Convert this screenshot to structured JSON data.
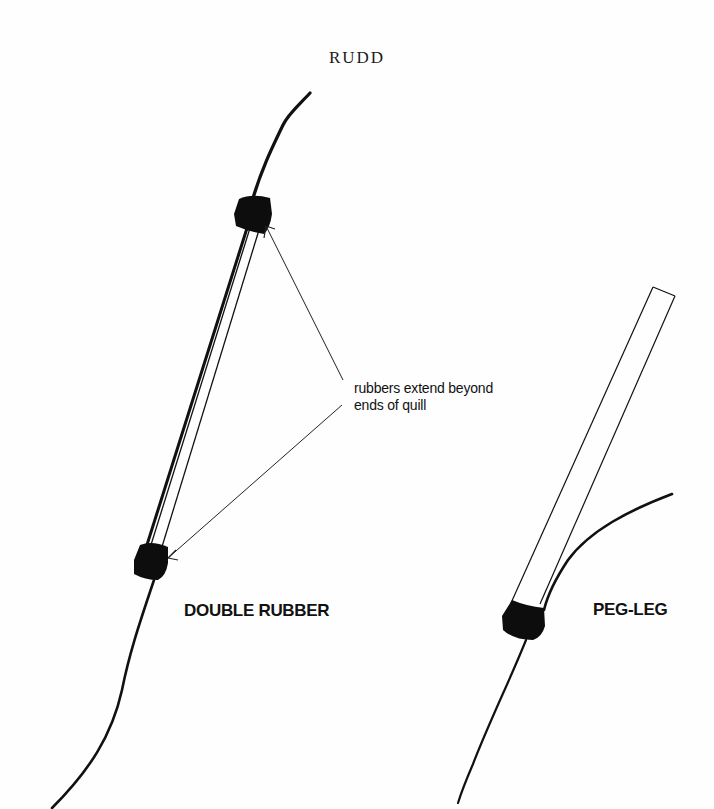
{
  "title": "RUDD",
  "callout": {
    "line1": "rubbers extend beyond",
    "line2": "ends of quill"
  },
  "rigs": [
    {
      "name": "DOUBLE RUBBER"
    },
    {
      "name": "PEG-LEG"
    }
  ],
  "colors": {
    "ink": "#111111",
    "background": "#fefefe"
  }
}
